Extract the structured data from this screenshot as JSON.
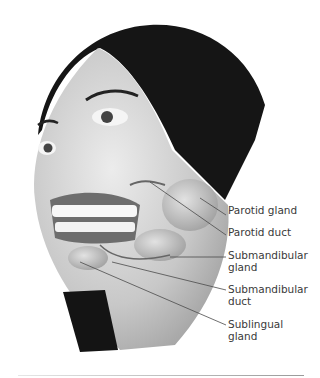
{
  "figure": {
    "labels": [
      {
        "text": "Parotid gland",
        "x": 228,
        "y": 210
      },
      {
        "text": "Parotid duct",
        "x": 228,
        "y": 230
      },
      {
        "text": "Submandibular\ngland",
        "x": 228,
        "y": 250
      },
      {
        "text": "Submandibular\nduct",
        "x": 228,
        "y": 283
      },
      {
        "text": "Sublingual\ngland",
        "x": 228,
        "y": 318
      }
    ]
  },
  "colors": {
    "hair": "#1a1a1a",
    "skin": "#c9c9c9",
    "gland": "#b8b8b8",
    "label_text": "#3a3a3a",
    "leader": "#4a4a4a"
  }
}
